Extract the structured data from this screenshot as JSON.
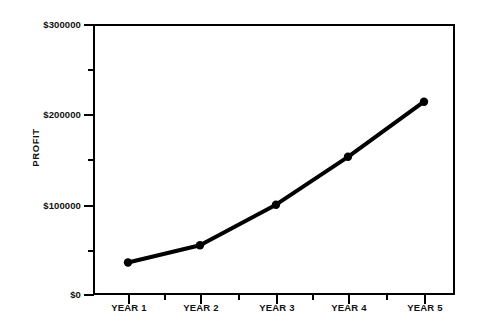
{
  "chart_data": {
    "type": "line",
    "title": "",
    "xlabel": "",
    "ylabel": "PROFIT",
    "categories": [
      "YEAR 1",
      "YEAR 2",
      "YEAR 3",
      "YEAR 4",
      "YEAR 5"
    ],
    "values": [
      36000,
      55000,
      100000,
      153000,
      214000
    ],
    "series": [
      {
        "name": "Profit",
        "values": [
          36000,
          55000,
          100000,
          153000,
          214000
        ]
      }
    ],
    "ylim": [
      0,
      300000
    ],
    "y_ticks": [
      0,
      100000,
      200000,
      300000
    ],
    "y_tick_labels": [
      "$0",
      "$100000",
      "$200000",
      "$300000"
    ],
    "y_minor_ticks": [
      50000,
      150000,
      250000
    ],
    "grid": false,
    "legend": false,
    "legend_position": "none",
    "marker": "filled-circle",
    "line_color": "#000000",
    "marker_color": "#000000",
    "background_color": "#ffffff",
    "frame": true
  },
  "axes": {
    "y_title": "PROFIT",
    "y_labels": [
      "$300000",
      "$200000",
      "$100000",
      "$0"
    ],
    "x_labels": [
      "YEAR 1",
      "YEAR 2",
      "YEAR 3",
      "YEAR 4",
      "YEAR 5"
    ]
  }
}
